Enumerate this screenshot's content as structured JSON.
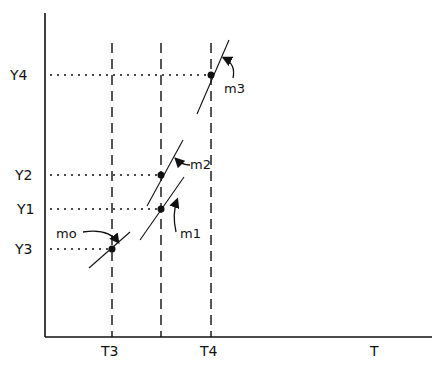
{
  "diagram": {
    "type": "time-series tangent-slope diagram",
    "axes": {
      "x_label": "T",
      "x_ticks": [
        "T3",
        "T4"
      ],
      "y_ticks": [
        "Y4",
        "Y2",
        "Y1",
        "Y3"
      ]
    },
    "points": [
      {
        "id": "p3",
        "x_ref": "T3",
        "y_ref": "Y3",
        "slope_label": "m0"
      },
      {
        "id": "p1",
        "x_ref": "mid",
        "y_ref": "Y1",
        "slope_label": "m1"
      },
      {
        "id": "p2",
        "x_ref": "mid",
        "y_ref": "Y2",
        "slope_label": "m2"
      },
      {
        "id": "p4",
        "x_ref": "T4",
        "y_ref": "Y4",
        "slope_label": "m3"
      }
    ],
    "labels": {
      "Y4": "Y4",
      "Y2": "Y2",
      "Y1": "Y1",
      "Y3": "Y3",
      "T3": "T3",
      "T4": "T4",
      "T": "T",
      "m0": "mo",
      "m1": "m1",
      "m2": "m2",
      "m3": "m3"
    },
    "colors": {
      "ink": "#111111",
      "background": "#ffffff"
    }
  }
}
